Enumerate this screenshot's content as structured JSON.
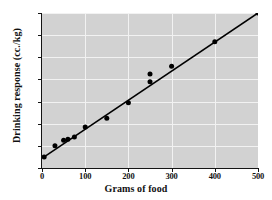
{
  "chart_data": {
    "type": "scatter",
    "title": "",
    "subtitle": "",
    "xlabel": "Grams of food",
    "ylabel": "Drinking response (cc./kg)",
    "xlim": [
      0,
      500
    ],
    "ylim": [
      0,
      70
    ],
    "xticks": [
      0,
      100,
      200,
      300,
      400,
      500
    ],
    "yticks": [
      0,
      10,
      20,
      30,
      40,
      50,
      60,
      70
    ],
    "xtick_labels": [
      "0",
      "100",
      "200",
      "300",
      "400",
      "500"
    ],
    "ytick_labels": [
      "0",
      "10",
      "20",
      "30",
      "40",
      "50",
      "60",
      "70"
    ],
    "grid": true,
    "grid_color": "#f2f2f2",
    "plot_background": "#d2d2d2",
    "marker_color": "#000000",
    "line_color": "#000000",
    "legend": null,
    "legend_position": "none",
    "series": [
      {
        "name": "observations",
        "kind": "scatter",
        "x": [
          5,
          30,
          50,
          60,
          75,
          100,
          150,
          200,
          250,
          250,
          300,
          400,
          500
        ],
        "y": [
          5,
          10,
          12.5,
          13,
          14,
          18.5,
          22.5,
          29.5,
          39,
          42.5,
          46,
          57,
          70
        ]
      },
      {
        "name": "fitted line",
        "kind": "line",
        "x": [
          5,
          500
        ],
        "y": [
          5,
          70
        ]
      }
    ]
  }
}
